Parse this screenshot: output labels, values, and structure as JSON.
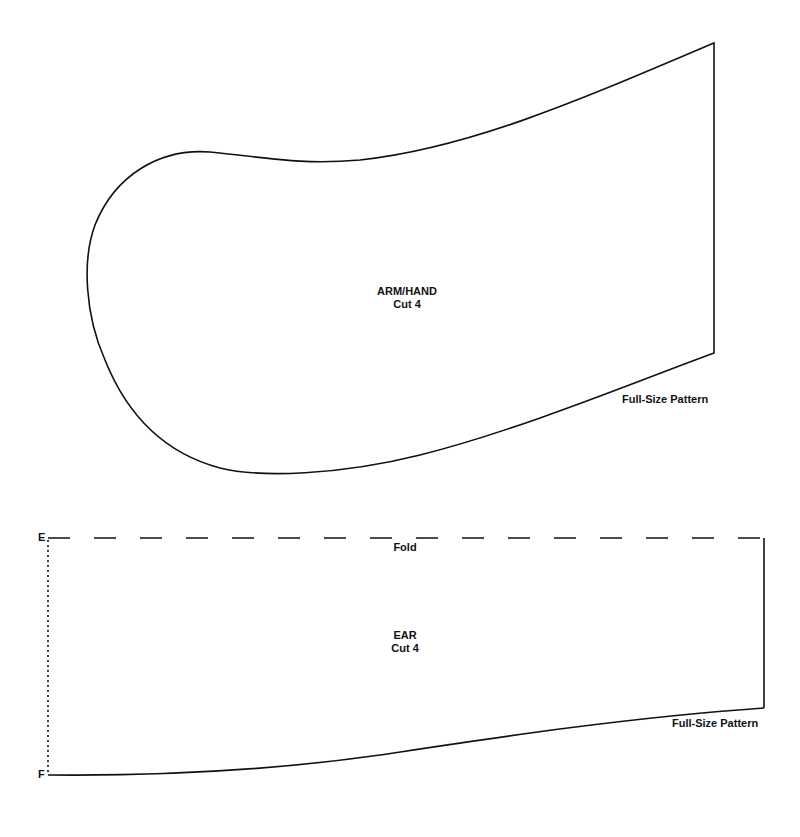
{
  "arm_hand": {
    "name": "ARM/HAND",
    "cut": "Cut 4",
    "note": "Full-Size Pattern"
  },
  "ear": {
    "name": "EAR",
    "cut": "Cut 4",
    "fold_label": "Fold",
    "point_top": "E",
    "point_bottom": "F",
    "note": "Full-Size Pattern"
  },
  "colors": {
    "line": "#111111",
    "background": "#ffffff"
  }
}
